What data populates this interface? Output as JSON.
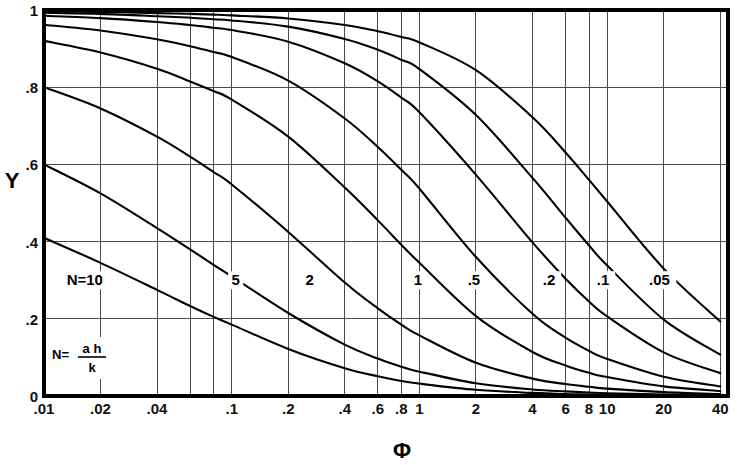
{
  "chart_data": {
    "type": "line",
    "title": "",
    "xlabel": "Φ",
    "ylabel": "Y",
    "xscale": "log",
    "xlim": [
      0.01,
      44
    ],
    "ylim": [
      0,
      1
    ],
    "grid": true,
    "legend_position": "inline-curve-labels",
    "annotation": {
      "lhs": "N=",
      "numerator": "a h",
      "denominator": "k",
      "full": "N = a h / k"
    },
    "x_ticks": [
      {
        "value": 0.01,
        "label": ".01"
      },
      {
        "value": 0.02,
        "label": ".02"
      },
      {
        "value": 0.04,
        "label": ".04"
      },
      {
        "value": 0.06,
        "label": ""
      },
      {
        "value": 0.08,
        "label": ""
      },
      {
        "value": 0.1,
        "label": ".1"
      },
      {
        "value": 0.2,
        "label": ".2"
      },
      {
        "value": 0.4,
        "label": ".4"
      },
      {
        "value": 0.6,
        "label": ".6"
      },
      {
        "value": 0.8,
        "label": ".8"
      },
      {
        "value": 1,
        "label": "1"
      },
      {
        "value": 2,
        "label": "2"
      },
      {
        "value": 4,
        "label": "4"
      },
      {
        "value": 6,
        "label": "6"
      },
      {
        "value": 8,
        "label": "8"
      },
      {
        "value": 10,
        "label": "10"
      },
      {
        "value": 20,
        "label": "20"
      },
      {
        "value": 40,
        "label": "40"
      }
    ],
    "y_ticks": [
      {
        "value": 0,
        "label": "0"
      },
      {
        "value": 0.2,
        "label": ".2"
      },
      {
        "value": 0.4,
        "label": ".4"
      },
      {
        "value": 0.6,
        "label": ".6"
      },
      {
        "value": 0.8,
        "label": ".8"
      },
      {
        "value": 1,
        "label": "1"
      }
    ],
    "x": [
      0.01,
      0.02,
      0.04,
      0.06,
      0.08,
      0.1,
      0.2,
      0.4,
      0.6,
      0.8,
      1,
      2,
      4,
      6,
      8,
      10,
      20,
      40
    ],
    "series": [
      {
        "name": "N=10",
        "label": "N=10",
        "label_x": 0.0165,
        "label_y": 0.3,
        "values": [
          0.41,
          0.345,
          0.275,
          0.233,
          0.205,
          0.185,
          0.122,
          0.072,
          0.051,
          0.039,
          0.032,
          0.016,
          0.008,
          0.005,
          0.004,
          0.003,
          0.002,
          0.001
        ]
      },
      {
        "name": "5",
        "label": "5",
        "label_x": 0.105,
        "label_y": 0.3,
        "values": [
          0.6,
          0.525,
          0.435,
          0.38,
          0.34,
          0.31,
          0.215,
          0.133,
          0.097,
          0.076,
          0.063,
          0.033,
          0.017,
          0.012,
          0.009,
          0.007,
          0.004,
          0.002
        ]
      },
      {
        "name": "2",
        "label": "2",
        "label_x": 0.26,
        "label_y": 0.3,
        "values": [
          0.8,
          0.745,
          0.672,
          0.62,
          0.58,
          0.548,
          0.425,
          0.294,
          0.227,
          0.185,
          0.157,
          0.086,
          0.045,
          0.031,
          0.024,
          0.019,
          0.01,
          0.005
        ]
      },
      {
        "name": "1",
        "label": "1",
        "label_x": 0.98,
        "label_y": 0.3,
        "values": [
          0.92,
          0.89,
          0.848,
          0.815,
          0.79,
          0.768,
          0.672,
          0.54,
          0.455,
          0.392,
          0.345,
          0.207,
          0.114,
          0.079,
          0.06,
          0.049,
          0.025,
          0.013
        ]
      },
      {
        "name": ".5",
        "label": ".5",
        "label_x": 1.95,
        "label_y": 0.3,
        "values": [
          0.962,
          0.947,
          0.924,
          0.906,
          0.891,
          0.878,
          0.817,
          0.719,
          0.645,
          0.586,
          0.537,
          0.36,
          0.213,
          0.151,
          0.117,
          0.096,
          0.05,
          0.025
        ]
      },
      {
        "name": ".2",
        "label": ".2",
        "label_x": 4.9,
        "label_y": 0.3,
        "values": [
          0.985,
          0.979,
          0.969,
          0.961,
          0.954,
          0.948,
          0.918,
          0.862,
          0.815,
          0.773,
          0.735,
          0.573,
          0.398,
          0.304,
          0.245,
          0.206,
          0.113,
          0.059
        ]
      },
      {
        "name": ".1",
        "label": ".1",
        "label_x": 9.5,
        "label_y": 0.3,
        "values": [
          0.993,
          0.99,
          0.984,
          0.98,
          0.976,
          0.973,
          0.957,
          0.925,
          0.897,
          0.871,
          0.847,
          0.728,
          0.565,
          0.462,
          0.39,
          0.338,
          0.198,
          0.107
        ]
      },
      {
        "name": ".05",
        "label": ".05",
        "label_x": 19,
        "label_y": 0.3,
        "values": [
          0.9965,
          0.995,
          0.992,
          0.99,
          0.988,
          0.986,
          0.978,
          0.961,
          0.945,
          0.93,
          0.916,
          0.844,
          0.722,
          0.631,
          0.56,
          0.504,
          0.33,
          0.193
        ]
      }
    ]
  },
  "geometry": {
    "plot_left": 44,
    "plot_right": 728,
    "plot_top": 10,
    "plot_bottom": 396
  }
}
